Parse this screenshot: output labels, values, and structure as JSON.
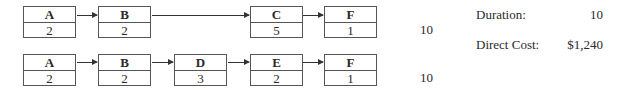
{
  "paths": [
    {
      "nodes": [
        {
          "name": "A",
          "duration": "2"
        },
        {
          "name": "B",
          "duration": "2"
        },
        {
          "name": "C",
          "duration": "5"
        },
        {
          "name": "F",
          "duration": "1"
        }
      ],
      "total": "10"
    },
    {
      "nodes": [
        {
          "name": "A",
          "duration": "2"
        },
        {
          "name": "B",
          "duration": "2"
        },
        {
          "name": "D",
          "duration": "3"
        },
        {
          "name": "E",
          "duration": "2"
        },
        {
          "name": "F",
          "duration": "1"
        }
      ],
      "total": "10"
    }
  ],
  "summary": {
    "duration_label": "Duration:",
    "duration_value": "10",
    "cost_label": "Direct Cost:",
    "cost_value": "$1,240"
  }
}
